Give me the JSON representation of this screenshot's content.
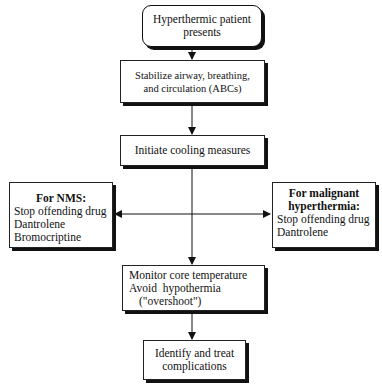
{
  "flowchart": {
    "start": {
      "line1": "Hyperthermic patient",
      "line2": "presents"
    },
    "abcs": {
      "line1": "Stabilize airway, breathing,",
      "line2": "and circulation (ABCs)"
    },
    "cooling": {
      "line1": "Initiate cooling measures"
    },
    "nms": {
      "title": "For NMS:",
      "items": [
        "Stop offending drug",
        "Dantrolene",
        "Bromocriptine"
      ]
    },
    "mh": {
      "title_line1": "For malignant",
      "title_line2": "hyperthermia:",
      "items": [
        "Stop offending drug",
        "Dantrolene"
      ]
    },
    "monitor": {
      "line1": "Monitor core temperature",
      "line2": "Avoid  hypothermia",
      "line3": "(\"overshoot\")"
    },
    "complications": {
      "line1": "Identify and treat",
      "line2": "complications"
    }
  }
}
